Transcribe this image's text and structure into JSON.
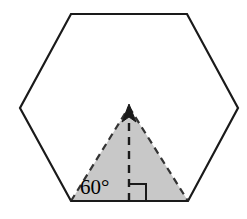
{
  "figure": {
    "background_color": "#ffffff",
    "stroke_color": "#1a1a1a",
    "shade_color": "#c8c8c8",
    "shade_stroke_color": "#333333"
  },
  "hexagon": {
    "name": "regular-hexagon",
    "sides": 6,
    "stroke_width": 2.2,
    "fill": "none",
    "vertices": [
      {
        "label": "top-left",
        "x": 71,
        "y": 14
      },
      {
        "label": "top-right",
        "x": 187,
        "y": 14
      },
      {
        "label": "right",
        "x": 238,
        "y": 108
      },
      {
        "label": "bottom-right",
        "x": 188,
        "y": 201
      },
      {
        "label": "bottom-left",
        "x": 71,
        "y": 201
      },
      {
        "label": "left",
        "x": 20,
        "y": 108
      }
    ],
    "points_attr": "71,14 187,14 238,108 188,201 71,201 20,108"
  },
  "triangle": {
    "name": "shaded-equilateral-triangle",
    "fill": "#c8c8c8",
    "stroke_width": 2.2,
    "dash_pattern": "7,5",
    "vertices": [
      {
        "label": "apex",
        "x": 129,
        "y": 107
      },
      {
        "label": "base-right",
        "x": 188,
        "y": 201
      },
      {
        "label": "base-left",
        "x": 71,
        "y": 201
      }
    ],
    "points_attr": "129,107 188,201 71,201",
    "left_edge": "M 71,201 L 129,107",
    "right_edge": "M 129,107 L 188,201"
  },
  "altitude": {
    "name": "altitude-dashed-arrow",
    "from": {
      "x": 129,
      "y": 201
    },
    "to": {
      "x": 129,
      "y": 113
    },
    "dash_pattern": "8,6",
    "stroke_width": 2.4,
    "arrowhead_points": "129,104 122,122 129,117 136,122"
  },
  "angle_label": {
    "name": "angle-60-degrees",
    "text": "60°",
    "x": 80,
    "y": 194,
    "font_size": 21
  },
  "right_angle_marker": {
    "name": "right-angle-marker",
    "path": "M 129,184 L 146,184 L 146,201",
    "size": 17,
    "stroke_width": 2.0
  }
}
